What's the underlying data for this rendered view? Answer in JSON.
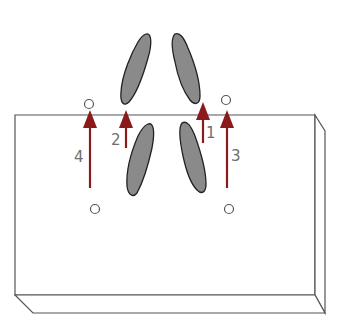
{
  "diagram": {
    "type": "foot-position-diagram",
    "colors": {
      "background": "#ffffff",
      "outline": "#555555",
      "footprint_fill": "#8a8a8a",
      "footprint_stroke": "#222222",
      "arrow": "#8b1a1a",
      "label": "#6e6e6e"
    },
    "block": {
      "description": "rectangular mat / platform in perspective"
    },
    "footprints": [
      {
        "id": "upper-left"
      },
      {
        "id": "upper-right"
      },
      {
        "id": "lower-left"
      },
      {
        "id": "lower-right"
      }
    ],
    "markers": [
      {
        "id": "top-left-circle"
      },
      {
        "id": "top-right-circle"
      },
      {
        "id": "bottom-left-circle"
      },
      {
        "id": "bottom-right-circle"
      }
    ],
    "arrows": [
      {
        "label": "1"
      },
      {
        "label": "2"
      },
      {
        "label": "3"
      },
      {
        "label": "4"
      }
    ]
  }
}
